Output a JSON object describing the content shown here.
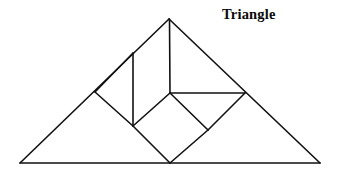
{
  "figure": {
    "title": "Triangle",
    "type": "tangram-dissection",
    "stroke_color": "#111111",
    "background_color": "#ffffff",
    "stroke_width": 1.6,
    "canvas": {
      "width": 338,
      "height": 173
    },
    "vertices": {
      "apex": [
        169,
        19
      ],
      "base_left": [
        20,
        163
      ],
      "base_right": [
        320,
        163
      ],
      "base_mid": [
        170,
        163
      ],
      "left_edge_point": [
        95,
        92
      ],
      "center": [
        170,
        93
      ],
      "right_point": [
        245,
        93
      ],
      "inner_left": [
        133,
        126
      ],
      "inner_right": [
        208,
        130
      ],
      "vertical_top": [
        133,
        53
      ]
    },
    "segments": [
      {
        "name": "outer-left-edge",
        "from": [
          169,
          19
        ],
        "to": [
          20,
          163
        ]
      },
      {
        "name": "outer-right-edge",
        "from": [
          169,
          19
        ],
        "to": [
          320,
          163
        ]
      },
      {
        "name": "outer-base",
        "from": [
          20,
          163
        ],
        "to": [
          320,
          163
        ]
      },
      {
        "name": "apex-vertical",
        "from": [
          169,
          19
        ],
        "to": [
          170,
          93
        ]
      },
      {
        "name": "center-horizontal",
        "from": [
          170,
          93
        ],
        "to": [
          245,
          93
        ]
      },
      {
        "name": "inner-vertical",
        "from": [
          133,
          53
        ],
        "to": [
          133,
          126
        ]
      },
      {
        "name": "left-diagonal-upper",
        "from": [
          95,
          92
        ],
        "to": [
          133,
          53
        ]
      },
      {
        "name": "left-diagonal-lower",
        "from": [
          95,
          92
        ],
        "to": [
          133,
          126
        ]
      },
      {
        "name": "diamond-upper-left",
        "from": [
          133,
          126
        ],
        "to": [
          170,
          93
        ]
      },
      {
        "name": "diamond-upper-right",
        "from": [
          170,
          93
        ],
        "to": [
          208,
          130
        ]
      },
      {
        "name": "diamond-lower-left",
        "from": [
          133,
          126
        ],
        "to": [
          170,
          163
        ]
      },
      {
        "name": "diamond-lower-right",
        "from": [
          208,
          130
        ],
        "to": [
          170,
          163
        ]
      },
      {
        "name": "right-diagonal",
        "from": [
          245,
          93
        ],
        "to": [
          208,
          130
        ]
      }
    ]
  }
}
